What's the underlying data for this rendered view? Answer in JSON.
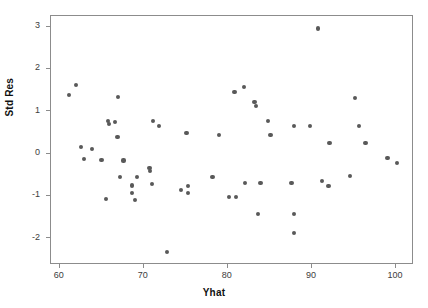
{
  "chart": {
    "title": "",
    "xlabel": "Yhat",
    "ylabel": "Std Res",
    "point_color": "#595959",
    "frame_color": "#8c8c8c",
    "background": "#ffffff"
  },
  "axes": {
    "x_ticks": [
      "60",
      "70",
      "80",
      "90",
      "100"
    ],
    "y_ticks": [
      "3",
      "2",
      "1",
      "0",
      "-1",
      "-2"
    ]
  },
  "chart_data": {
    "type": "scatter",
    "title": "",
    "xlabel": "Yhat",
    "ylabel": "Std Res",
    "xlim": [
      58.0,
      102.1
    ],
    "ylim": [
      -2.65,
      3.25
    ],
    "xticks": [
      60,
      70,
      80,
      90,
      100
    ],
    "yticks": [
      -2,
      -1,
      0,
      1,
      2,
      3
    ],
    "grid": false,
    "legend": null,
    "marker": "circle",
    "marker_color": "#595959",
    "marker_size": 4,
    "n_points": 56,
    "points": [
      {
        "x": 62.1,
        "y": 1.59
      },
      {
        "x": 61.2,
        "y": 1.36
      },
      {
        "x": 62.7,
        "y": 0.13
      },
      {
        "x": 63.0,
        "y": -0.16
      },
      {
        "x": 64.0,
        "y": 0.08
      },
      {
        "x": 65.1,
        "y": -0.18
      },
      {
        "x": 65.6,
        "y": -1.1
      },
      {
        "x": 67.1,
        "y": 1.31
      },
      {
        "x": 65.9,
        "y": 0.75
      },
      {
        "x": 66.0,
        "y": 0.68
      },
      {
        "x": 66.7,
        "y": 0.72
      },
      {
        "x": 67.3,
        "y": -0.57
      },
      {
        "x": 67.0,
        "y": 0.37
      },
      {
        "x": 67.7,
        "y": -0.19
      },
      {
        "x": 68.7,
        "y": -0.78
      },
      {
        "x": 68.7,
        "y": -0.96
      },
      {
        "x": 69.3,
        "y": -0.58
      },
      {
        "x": 71.2,
        "y": 0.74
      },
      {
        "x": 71.9,
        "y": 0.63
      },
      {
        "x": 71.1,
        "y": -0.74
      },
      {
        "x": 70.9,
        "y": -0.44
      },
      {
        "x": 70.8,
        "y": -0.36
      },
      {
        "x": 75.2,
        "y": 0.46
      },
      {
        "x": 75.4,
        "y": -0.79
      },
      {
        "x": 75.4,
        "y": -0.96
      },
      {
        "x": 74.5,
        "y": -0.89
      },
      {
        "x": 69.1,
        "y": -1.12
      },
      {
        "x": 72.9,
        "y": -2.35
      },
      {
        "x": 79.1,
        "y": 0.41
      },
      {
        "x": 78.3,
        "y": -0.58
      },
      {
        "x": 80.9,
        "y": 1.43
      },
      {
        "x": 81.1,
        "y": -1.06
      },
      {
        "x": 82.0,
        "y": 1.55
      },
      {
        "x": 83.3,
        "y": 1.2
      },
      {
        "x": 83.5,
        "y": 1.1
      },
      {
        "x": 84.9,
        "y": 0.75
      },
      {
        "x": 85.2,
        "y": 0.41
      },
      {
        "x": 84.0,
        "y": -0.72
      },
      {
        "x": 80.3,
        "y": -1.05
      },
      {
        "x": 82.2,
        "y": -0.72
      },
      {
        "x": 83.7,
        "y": -1.45
      },
      {
        "x": 87.7,
        "y": -0.72
      },
      {
        "x": 88.0,
        "y": -1.46
      },
      {
        "x": 88.0,
        "y": -1.9
      },
      {
        "x": 89.9,
        "y": 0.63
      },
      {
        "x": 88.0,
        "y": 0.62
      },
      {
        "x": 90.8,
        "y": 2.93
      },
      {
        "x": 91.3,
        "y": -0.67
      },
      {
        "x": 92.1,
        "y": -0.79
      },
      {
        "x": 95.2,
        "y": 1.29
      },
      {
        "x": 92.2,
        "y": 0.22
      },
      {
        "x": 95.7,
        "y": 0.63
      },
      {
        "x": 96.5,
        "y": 0.22
      },
      {
        "x": 99.1,
        "y": -0.13
      },
      {
        "x": 100.2,
        "y": -0.25
      },
      {
        "x": 94.6,
        "y": -0.56
      }
    ]
  }
}
